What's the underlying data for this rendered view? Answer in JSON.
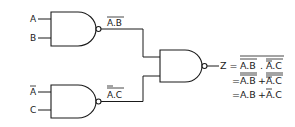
{
  "diagram": {
    "type": "logic-circuit",
    "colors": {
      "ink": "#1a1a1a",
      "background": "#ffffff"
    },
    "inputs": [
      {
        "id": "A",
        "label": "A",
        "negated": false
      },
      {
        "id": "B",
        "label": "B",
        "negated": false
      },
      {
        "id": "Abar",
        "label": "A",
        "negated": true
      },
      {
        "id": "C",
        "label": "C",
        "negated": false
      }
    ],
    "gates": [
      {
        "id": "g1",
        "type": "NAND",
        "inputs": [
          "A",
          "B"
        ],
        "output_label": "A.B",
        "output_negated": true
      },
      {
        "id": "g2",
        "type": "NAND",
        "inputs": [
          "Abar",
          "C"
        ],
        "output_label": "A.C",
        "output_negated": true
      },
      {
        "id": "g3",
        "type": "NAND",
        "inputs": [
          "g1",
          "g2"
        ],
        "output": "Z"
      }
    ],
    "labels": {
      "in_a": "A",
      "in_b": "B",
      "in_abar": "A",
      "in_c": "C",
      "g1_out": "A.B",
      "g2_out": "A.C",
      "z": "Z"
    },
    "equations": [
      {
        "prefix": "Z =",
        "text": "A.B . A.C",
        "description": "NOT( NOT(A.B) . NOT(NOT(A).C) )"
      },
      {
        "prefix": "=",
        "text": "A.B + A.C",
        "description": "NOT(NOT(A.B)) + NOT(NOT(NOT(A).C))"
      },
      {
        "prefix": "=",
        "text": "A.B + A.C",
        "description": "A.B + NOT(A).C"
      }
    ],
    "eq_parts": {
      "l1_z": "Z =",
      "l1_ab": "A.B",
      "l1_dot": ".",
      "l1_ac": "A.C",
      "l2_eq": "=",
      "l2_ab": "A.B",
      "l2_plus": "+",
      "l2_ac": "A.C",
      "l3_eq": "=",
      "l3_ab": "A.B",
      "l3_plus": "+",
      "l3_ac": "A.C"
    }
  }
}
